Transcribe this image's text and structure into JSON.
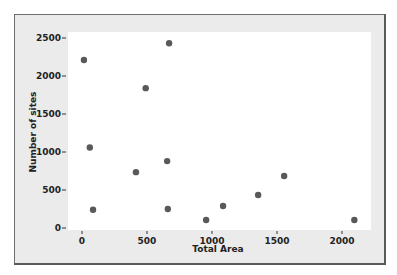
{
  "chart_data": {
    "type": "scatter",
    "title": "",
    "xlabel": "Total Area",
    "ylabel": "Number of sites",
    "xlim": [
      -100,
      2220
    ],
    "ylim": [
      -50,
      2640
    ],
    "xticks": [
      0,
      500,
      1000,
      1500,
      2000
    ],
    "yticks": [
      0,
      500,
      1000,
      1500,
      2000,
      2500
    ],
    "grid": false,
    "legend": null,
    "marker_color": "#595959",
    "points": [
      {
        "x": 15,
        "y": 2210
      },
      {
        "x": 670,
        "y": 2430
      },
      {
        "x": 490,
        "y": 1840
      },
      {
        "x": 60,
        "y": 1060
      },
      {
        "x": 415,
        "y": 735
      },
      {
        "x": 655,
        "y": 880
      },
      {
        "x": 85,
        "y": 240
      },
      {
        "x": 660,
        "y": 250
      },
      {
        "x": 955,
        "y": 105
      },
      {
        "x": 1085,
        "y": 290
      },
      {
        "x": 1355,
        "y": 435
      },
      {
        "x": 1555,
        "y": 685
      },
      {
        "x": 2095,
        "y": 105
      }
    ]
  },
  "colors": {
    "frame_bg": "#ebebeb",
    "plot_bg": "#ffffff",
    "marker": "#595959"
  }
}
